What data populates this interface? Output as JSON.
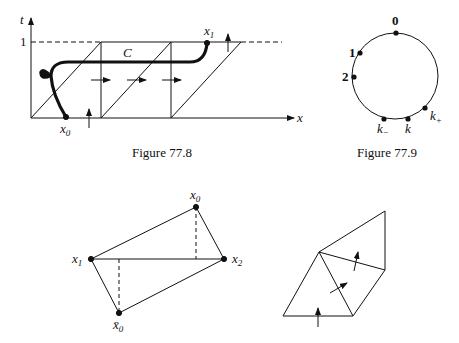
{
  "figures": [
    {
      "id": "fig-77-8",
      "caption": "Figure 77.8",
      "labels": {
        "t_axis": "t",
        "x_axis": "x",
        "one": "1",
        "curve": "C",
        "start_point": "x",
        "start_point_sub": "0",
        "end_point": "x",
        "end_point_sub": "1"
      }
    },
    {
      "id": "fig-77-9",
      "caption": "Figure 77.9",
      "labels": {
        "p0": "0",
        "p1": "1",
        "p2": "2",
        "k_minus": "k",
        "k_minus_sub": "−",
        "k": "k",
        "k_plus": "k",
        "k_plus_sub": "+"
      }
    },
    {
      "id": "fig-quad",
      "labels": {
        "x0": "x",
        "x0_sub": "0",
        "x1": "x",
        "x1_sub": "1",
        "x2": "x",
        "x2_sub": "2",
        "x0bar": "x̄",
        "x0bar_sub": "0"
      }
    },
    {
      "id": "fig-triangles",
      "labels": {}
    }
  ]
}
